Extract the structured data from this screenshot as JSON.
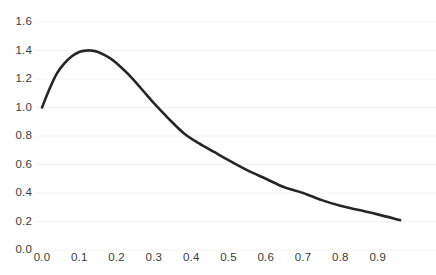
{
  "chart_data": {
    "type": "line",
    "title": "",
    "xlabel": "",
    "ylabel": "",
    "xlim": [
      0.0,
      1.0
    ],
    "ylim": [
      0.0,
      1.6
    ],
    "grid": true,
    "grid_axis": "y",
    "legend": false,
    "legend_position": "none",
    "line_color": "#262626",
    "line_width": 2.6,
    "background_color": "#ffffff",
    "grid_color": "#f2f2f2",
    "tick_label_color": "#3b3b3b",
    "xticks": [
      0.0,
      0.1,
      0.2,
      0.3,
      0.4,
      0.5,
      0.6,
      0.7,
      0.8,
      0.9
    ],
    "xtick_labels": [
      "0.0",
      "0.1",
      "0.2",
      "0.3",
      "0.4",
      "0.5",
      "0.6",
      "0.7",
      "0.8",
      "0.9"
    ],
    "yticks": [
      0.0,
      0.2,
      0.4,
      0.6,
      0.8,
      1.0,
      1.2,
      1.4,
      1.6
    ],
    "ytick_labels": [
      "0.0",
      "0.2",
      "0.4",
      "0.6",
      "0.8",
      "1.0",
      "1.2",
      "1.4",
      "1.6"
    ],
    "series": [
      {
        "name": "curve",
        "x": [
          0.0,
          0.02,
          0.04,
          0.06,
          0.08,
          0.1,
          0.12,
          0.13,
          0.15,
          0.18,
          0.2,
          0.24,
          0.28,
          0.3,
          0.34,
          0.38,
          0.42,
          0.46,
          0.5,
          0.55,
          0.6,
          0.65,
          0.7,
          0.75,
          0.8,
          0.85,
          0.9,
          0.96
        ],
        "y": [
          1.0,
          1.13,
          1.24,
          1.31,
          1.36,
          1.39,
          1.4,
          1.4,
          1.39,
          1.35,
          1.31,
          1.21,
          1.09,
          1.03,
          0.92,
          0.82,
          0.75,
          0.69,
          0.63,
          0.56,
          0.5,
          0.44,
          0.4,
          0.35,
          0.31,
          0.28,
          0.25,
          0.21
        ]
      }
    ]
  },
  "axes": {
    "x_pixel_origin": 42,
    "x_pixel_per_unit": 373,
    "y_pixel_origin": 250,
    "y_pixel_per_unit": 142.5
  }
}
